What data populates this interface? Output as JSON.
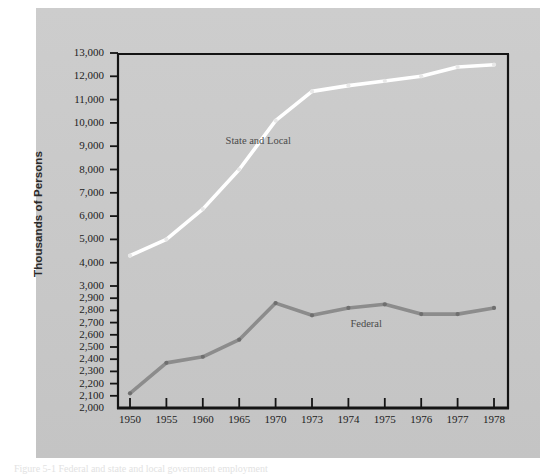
{
  "figure": {
    "caption": "Figure 5-1  Federal and state and local government employment",
    "background_color": "#c9c9c9",
    "page_color": "#ffffff"
  },
  "chart_data": {
    "type": "line",
    "title": "",
    "subtitle": "",
    "xlabel": "",
    "ylabel": "Thousands of Persons",
    "categories": [
      "1950",
      "1955",
      "1960",
      "1965",
      "1970",
      "1973",
      "1974",
      "1975",
      "1976",
      "1977",
      "1978"
    ],
    "series": [
      {
        "name": "State and Local",
        "color": "#ffffff",
        "values": [
          4300,
          5000,
          6300,
          8000,
          10100,
          11350,
          11600,
          11800,
          12000,
          12400,
          12500
        ]
      },
      {
        "name": "Federal",
        "color": "#8c8c8c",
        "values": [
          2120,
          2370,
          2420,
          2560,
          2860,
          2760,
          2820,
          2850,
          2770,
          2770,
          2820
        ]
      }
    ],
    "y_axis": {
      "broken_scale": true,
      "tick_labels": [
        "2,000",
        "2,100",
        "2,200",
        "2,300",
        "2,400",
        "2,500",
        "2,600",
        "2,700",
        "2,800",
        "2,900",
        "3,000",
        "4,000",
        "5,000",
        "6,000",
        "7,000",
        "8,000",
        "9,000",
        "10,000",
        "11,000",
        "12,000",
        "13,000"
      ],
      "tick_values": [
        2000,
        2100,
        2200,
        2300,
        2400,
        2500,
        2600,
        2700,
        2800,
        2900,
        3000,
        4000,
        5000,
        6000,
        7000,
        8000,
        9000,
        10000,
        11000,
        12000,
        13000
      ],
      "lower_band": {
        "from": 2000,
        "to": 3000,
        "step": 100
      },
      "upper_band": {
        "from": 3000,
        "to": 13000,
        "step": 1000
      },
      "ylim": [
        2000,
        13000
      ]
    },
    "x_axis": {
      "spacing": "categorical-equal",
      "tick_labels": [
        "1950",
        "1955",
        "1960",
        "1965",
        "1970",
        "1973",
        "1974",
        "1975",
        "1976",
        "1977",
        "1978"
      ]
    },
    "grid": false,
    "legend": "inline-annotations",
    "annotations": [
      {
        "text": "State and Local",
        "series": "State and Local"
      },
      {
        "text": "Federal",
        "series": "Federal"
      }
    ],
    "axis_color": "#141414",
    "marker": "small-round"
  }
}
